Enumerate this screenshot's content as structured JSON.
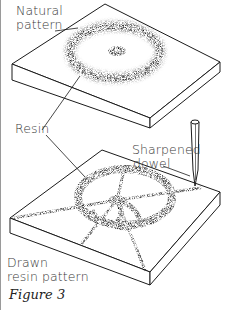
{
  "figure": {
    "caption": "Figure 3",
    "labels": {
      "natural_line1": "Natural",
      "natural_line2": "pattern",
      "resin": "Resin",
      "dowel_line1": "Sharpened",
      "dowel_line2": "dowel",
      "drawn_line1": "Drawn",
      "drawn_line2": "resin pattern"
    },
    "colors": {
      "ink": "#1a1a1a",
      "text": "#3a3a3a",
      "border": "#9a9a9a",
      "background": "#ffffff"
    }
  }
}
